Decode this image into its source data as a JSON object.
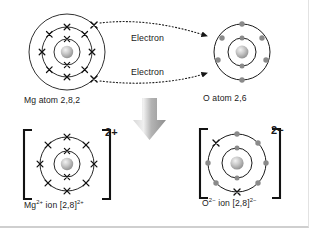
{
  "figure": {
    "background_color": "#ffffff",
    "stroke_color": "#1a1a1a",
    "cross_color": "#111111",
    "dot_color": "#8a8a8a",
    "arrow_fill_color": "#9d9d9d"
  },
  "reactants": {
    "magnesium": {
      "label": "Mg atom 2,8,2",
      "element": "Mg",
      "configuration": "2,8,2",
      "shells": [
        {
          "index": 1,
          "electron_count": 2,
          "marker": "cross"
        },
        {
          "index": 2,
          "electron_count": 8,
          "marker": "cross"
        },
        {
          "index": 3,
          "electron_count": 2,
          "marker": "cross"
        }
      ],
      "center": {
        "x": 67,
        "y": 52
      },
      "shell_radii": [
        13,
        25,
        38
      ]
    },
    "oxygen": {
      "label": "O atom 2,6",
      "element": "O",
      "configuration": "2,6",
      "shells": [
        {
          "index": 1,
          "electron_count": 2,
          "marker": "dot"
        },
        {
          "index": 2,
          "electron_count": 6,
          "marker": "dot"
        }
      ],
      "center": {
        "x": 242,
        "y": 52
      },
      "shell_radii": [
        14,
        28
      ]
    }
  },
  "products": {
    "magnesium_ion": {
      "label_html": "Mg2+ ion [2,8]2+",
      "label_base": "Mg",
      "label_sup_1": "2+",
      "label_mid": " ion [2,8]",
      "label_sup_2": "2+",
      "charge": "2+",
      "configuration": "[2,8]",
      "shells": [
        {
          "index": 1,
          "electron_count": 2,
          "marker": "cross"
        },
        {
          "index": 2,
          "electron_count": 8,
          "marker": "cross"
        }
      ],
      "center": {
        "x": 67,
        "y": 163
      },
      "shell_radii": [
        13,
        27
      ],
      "bracket": true
    },
    "oxide_ion": {
      "label_html": "O2- ion [2,8]2-",
      "label_base": "O",
      "label_sup_1": "2−",
      "label_mid": " ion [2,8]",
      "label_sup_2": "2−",
      "charge": "2−",
      "configuration": "[2,8]",
      "shells": [
        {
          "index": 1,
          "electron_count": 2,
          "marker": "dot"
        },
        {
          "index": 2,
          "electron_count": 8,
          "marker": "mixed",
          "dots": 6,
          "crosses": 2,
          "note": "six original oxygen electrons plus two transferred magnesium electrons shown as crosses"
        }
      ],
      "center": {
        "x": 236,
        "y": 163
      },
      "shell_radii": [
        14,
        29
      ],
      "bracket": true
    }
  },
  "annotations": {
    "electron_transfer_1": "Electron",
    "electron_transfer_2": "Electron",
    "charge_mg": "2+",
    "charge_o": "2−",
    "transfer_arrow_style": "dotted-with-solid-head",
    "reaction_arrow": "large-grey-down-arrow"
  }
}
